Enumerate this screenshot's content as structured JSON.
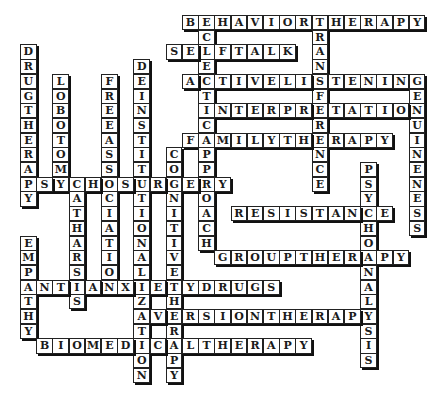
{
  "puzzle": {
    "layout": {
      "origin_x": 20,
      "origin_y": 15,
      "cell_w": 16.2,
      "cell_h": 14.7,
      "cols": 25,
      "rows": 25
    },
    "words": [
      {
        "answer": "BEHAVIORTHERAPY",
        "dir": "across",
        "row": 0,
        "col": 10
      },
      {
        "answer": "ECLECTIC",
        "dir": "down",
        "row": 0,
        "col": 11
      },
      {
        "answer": "TRANSFERENCE",
        "dir": "down",
        "row": 0,
        "col": 18
      },
      {
        "answer": "SELFTALK",
        "dir": "across",
        "row": 2,
        "col": 9
      },
      {
        "answer": "DRUGTHERAPY",
        "dir": "down",
        "row": 2,
        "col": 0
      },
      {
        "answer": "DEINSTITUTIONALIZATION",
        "dir": "down",
        "row": 3,
        "col": 7
      },
      {
        "answer": "LOBOTOMY",
        "dir": "down",
        "row": 4,
        "col": 2
      },
      {
        "answer": "FREEASSOCIATION",
        "dir": "down",
        "row": 4,
        "col": 5
      },
      {
        "answer": "ACTIVELISTENING",
        "dir": "across",
        "row": 4,
        "col": 10
      },
      {
        "answer": "GENUINENESS",
        "dir": "down",
        "row": 4,
        "col": 24
      },
      {
        "answer": "INTERPRETATION",
        "dir": "across",
        "row": 6,
        "col": 11
      },
      {
        "answer": "FAMILYTHERAPY",
        "dir": "across",
        "row": 8,
        "col": 10
      },
      {
        "answer": "APPROACH",
        "dir": "down",
        "row": 8,
        "col": 11
      },
      {
        "answer": "COGNITIVETHERAPY",
        "dir": "down",
        "row": 9,
        "col": 9
      },
      {
        "answer": "PSYCHOANALYSIS",
        "dir": "down",
        "row": 10,
        "col": 21
      },
      {
        "answer": "PSYCHOSURGERY",
        "dir": "across",
        "row": 11,
        "col": 0
      },
      {
        "answer": "CATHARSIS",
        "dir": "down",
        "row": 11,
        "col": 3
      },
      {
        "answer": "RESISTANCE",
        "dir": "across",
        "row": 13,
        "col": 13
      },
      {
        "answer": "EMPATHY",
        "dir": "down",
        "row": 15,
        "col": 0
      },
      {
        "answer": "GROUPTHERAPY",
        "dir": "across",
        "row": 16,
        "col": 12
      },
      {
        "answer": "ANTIANXIETYDRUGS",
        "dir": "across",
        "row": 18,
        "col": 0
      },
      {
        "answer": "AVERSIONTHERAPY",
        "dir": "across",
        "row": 20,
        "col": 7
      },
      {
        "answer": "BIOMEDICALTHERAPY",
        "dir": "across",
        "row": 22,
        "col": 1
      }
    ]
  }
}
